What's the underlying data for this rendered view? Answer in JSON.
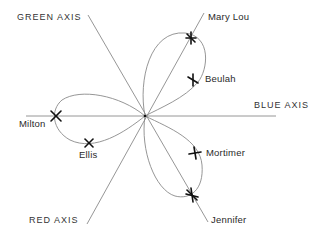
{
  "diagram": {
    "axes": [
      {
        "id": "green",
        "label": "GREEN AXIS"
      },
      {
        "id": "blue",
        "label": "BLUE AXIS"
      },
      {
        "id": "red",
        "label": "RED AXIS"
      }
    ],
    "points": [
      {
        "name": "Mary Lou"
      },
      {
        "name": "Beulah"
      },
      {
        "name": "Milton"
      },
      {
        "name": "Ellis"
      },
      {
        "name": "Mortimer"
      },
      {
        "name": "Jennifer"
      }
    ],
    "colors": {
      "line": "#8a8a8a",
      "marker": "#111111",
      "text": "#2a2a2a"
    }
  }
}
